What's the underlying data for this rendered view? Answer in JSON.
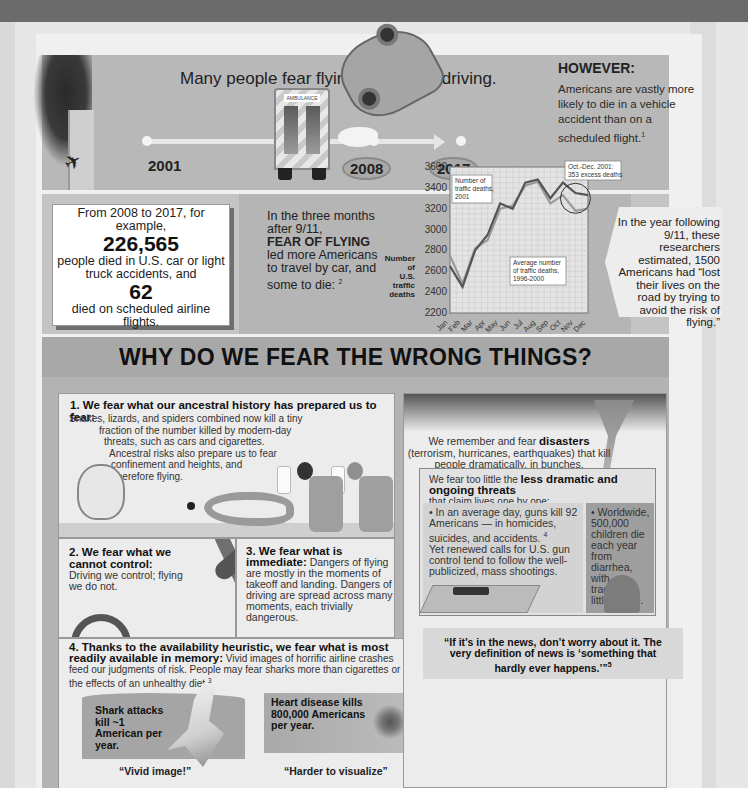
{
  "timeline": {
    "title": "Many people fear flying more than driving.",
    "years": [
      "2001",
      "2008",
      "2017"
    ],
    "however_title": "HOWEVER:",
    "however_text": "Americans are vastly more likely to die in a vehicle accident than on a scheduled flight.",
    "however_footnote": "1",
    "ambulance_sign": "AMBULANCE"
  },
  "stat_box": {
    "line1": "From 2008 to 2017, for example,",
    "car_deaths": "226,565",
    "line2": "people died in U.S. car or light truck accidents, and",
    "air_deaths": "62",
    "line3": "died on scheduled airline flights."
  },
  "fear_of_flying": {
    "line1": "In the three months after 9/11,",
    "emphasis": "FEAR OF FLYING",
    "line2": "led more Americans to travel by car, and some to die:",
    "footnote": "2"
  },
  "researchers_quote": {
    "text": "In the year following 9/11, these researchers estimated, 1500 Americans had “lost their lives on the road by trying to avoid the risk of flying.”"
  },
  "chart_data": {
    "type": "line",
    "title": "",
    "xlabel": "",
    "ylabel": "Number of U.S. traffic deaths",
    "categories": [
      "Jan",
      "Feb",
      "Mar",
      "Apr",
      "May",
      "Jun",
      "Jul",
      "Aug",
      "Sep",
      "Oct",
      "Nov",
      "Dec"
    ],
    "yticks": [
      2200,
      2400,
      2600,
      2800,
      3000,
      3200,
      3400,
      3600
    ],
    "ylim": [
      2200,
      3600
    ],
    "grid": true,
    "series": [
      {
        "name": "Number of traffic deaths, 2001",
        "values": [
          2650,
          2450,
          2800,
          2950,
          3250,
          3200,
          3450,
          3480,
          3300,
          3450,
          3350,
          3330
        ],
        "color": "#555555"
      },
      {
        "name": "Average number of traffic deaths, 1996-2000",
        "values": [
          2750,
          2480,
          2820,
          2900,
          3200,
          3230,
          3420,
          3460,
          3250,
          3330,
          3180,
          3200
        ],
        "color": "#9a9a9a"
      }
    ],
    "annotations": [
      {
        "label": "Number of traffic deaths, 2001",
        "target": "series_0"
      },
      {
        "label": "Average number of traffic deaths, 1996-2000",
        "target": "series_1"
      },
      {
        "label": "Oct.-Dec. 2001: 353 excess deaths",
        "target": "Oct-Dec"
      }
    ],
    "ylabel_lines": [
      "Number",
      "of",
      "U.S.",
      "traffic",
      "deaths"
    ]
  },
  "why": {
    "title": "WHY DO WE FEAR THE WRONG THINGS?",
    "reason1": {
      "title": "1. We fear what our ancestral history has prepared us to fear:",
      "lines": [
        "Snakes, lizards, and spiders combined now kill a tiny",
        "fraction of the number killed by modern-day",
        "threats, such as cars and cigarettes.",
        "Ancestral risks also prepare us to fear",
        "confinement and heights, and",
        "therefore flying."
      ]
    },
    "reason2": {
      "title": "2. We fear what we cannot control:",
      "text": "Driving we control; flying we do not."
    },
    "reason3": {
      "title": "3. We fear what is immediate:",
      "text": "Dangers of flying are mostly in the moments of takeoff and landing. Dangers of driving are spread across many moments, each trivially dangerous."
    },
    "reason4": {
      "title": "4. Thanks to the availability heuristic, we fear what is most readily available in memory:",
      "text": "Vivid images of horrific airline crashes feed our judgments of risk. People may fear sharks more than cigarettes or the effects of an unhealthy diet.",
      "footnote": "3",
      "shark_text": "Shark attacks kill ~1 American per year.",
      "shark_caption": "“Vivid image!”",
      "heart_text": "Heart disease kills 800,000 Americans per year.",
      "heart_caption": "“Harder to visualize”"
    },
    "disasters": {
      "pre": "We remember and fear",
      "emphasis": "disasters",
      "post": "(terrorism, hurricanes, earthquakes) that kill people dramatically, in bunches."
    },
    "threats": {
      "pre": "We fear too little the",
      "emphasis": "less dramatic and ongoing threats",
      "post": "that claim lives one by one:",
      "guns": "• In an average day, guns kill 92 Americans — in homicides, suicides, and accidents.",
      "guns_footnote": "4",
      "guns_cont": "Yet renewed calls for U.S. gun control tend to follow the well-publicized, mass shootings.",
      "diarrhea": "• Worldwide, 500,000 children die each year from diarrhea, with tragically little notice."
    },
    "news_quote": "“If it’s in the news, don’t worry about it. The very definition of news is ‘something that hardly ever happens.’”",
    "news_footnote": "5"
  }
}
